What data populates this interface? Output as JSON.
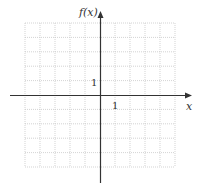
{
  "chart_data": {
    "type": "line",
    "title": "",
    "xlabel": "x",
    "ylabel": "f(x)",
    "xlim": [
      -5,
      5
    ],
    "ylim": [
      -5,
      5
    ],
    "grid": true,
    "grid_style": "dotted",
    "tick_labels": {
      "x": [
        "1"
      ],
      "y": [
        "1"
      ]
    },
    "series": []
  },
  "labels": {
    "x_axis": "x",
    "y_axis": "f(x)",
    "x_tick_one": "1",
    "y_tick_one": "1"
  },
  "colors": {
    "axis": "#333333",
    "grid": "#c8c8c8",
    "background": "#ffffff"
  }
}
